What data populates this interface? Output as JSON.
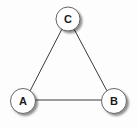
{
  "diagram": {
    "type": "graph",
    "nodes": [
      {
        "id": "C",
        "label": "C",
        "cx": 68,
        "cy": 19,
        "r": 12
      },
      {
        "id": "A",
        "label": "A",
        "cx": 23,
        "cy": 101,
        "r": 12.5
      },
      {
        "id": "B",
        "label": "B",
        "cx": 114,
        "cy": 101,
        "r": 12.5
      }
    ],
    "edges": [
      {
        "from": "C",
        "to": "A"
      },
      {
        "from": "C",
        "to": "B"
      },
      {
        "from": "A",
        "to": "B"
      }
    ],
    "colors": {
      "background": "#ffffff",
      "edge": "#3a3a3a",
      "node_fill": "#ffffff",
      "node_stroke": "#555555",
      "node_shadow": "#bdbdbd",
      "label": "#1a1a1a"
    }
  }
}
